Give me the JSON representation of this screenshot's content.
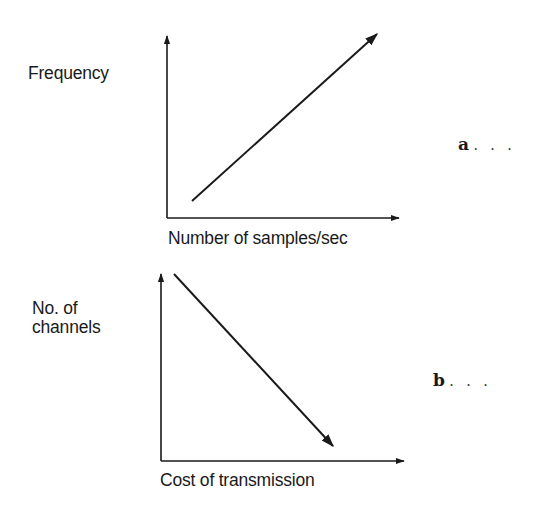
{
  "figure": {
    "panels": [
      {
        "id": "a",
        "part_label": "a",
        "ellipsis": ". . .",
        "y_label": "Frequency",
        "x_label": "Number of samples/sec",
        "relationship": "increasing",
        "line": {
          "from": [
            192,
            201
          ],
          "to": [
            376,
            34
          ],
          "arrowhead": "end"
        },
        "axes": {
          "origin": [
            167,
            218
          ],
          "y_top": 37,
          "x_right": 398
        }
      },
      {
        "id": "b",
        "part_label": "b",
        "ellipsis": ". . .",
        "y_label_lines": [
          "No. of",
          "channels"
        ],
        "x_label": "Cost of transmission",
        "relationship": "decreasing",
        "line": {
          "from": [
            174,
            274
          ],
          "to": [
            332,
            445
          ],
          "arrowhead": "end"
        },
        "axes": {
          "origin": [
            161,
            461
          ],
          "y_top": 275,
          "x_right": 403
        }
      }
    ],
    "stroke_color": "#1a1a1a"
  }
}
